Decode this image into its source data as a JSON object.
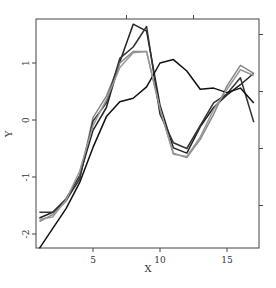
{
  "chart_data": {
    "type": "line",
    "title": "",
    "xlabel": "X",
    "ylabel": "Y",
    "xlim": [
      0.8,
      17.4
    ],
    "ylim": [
      -2.25,
      1.78
    ],
    "grid": false,
    "legend": null,
    "x_ticks": [
      5,
      10,
      15
    ],
    "y_ticks": [
      -2,
      -1,
      0,
      1
    ],
    "x": [
      1,
      2,
      3,
      4,
      5,
      6,
      7,
      8,
      9,
      10,
      11,
      12,
      13,
      14,
      15,
      16,
      17
    ],
    "series": [
      {
        "name": "series-1",
        "color": "#222222",
        "values": [
          -1.72,
          -1.62,
          -1.38,
          -0.98,
          -0.18,
          0.22,
          1.02,
          1.68,
          1.56,
          0.26,
          -0.49,
          -0.58,
          -0.12,
          0.22,
          0.44,
          0.62,
          0.82
        ]
      },
      {
        "name": "series-2",
        "color": "#888888",
        "values": [
          -1.78,
          -1.66,
          -1.42,
          -1.02,
          0.04,
          0.42,
          1.0,
          1.2,
          1.2,
          0.18,
          -0.58,
          -0.66,
          -0.34,
          0.1,
          0.6,
          0.96,
          0.82
        ]
      },
      {
        "name": "series-3",
        "color": "#333333",
        "values": [
          -1.62,
          -1.62,
          -1.4,
          -1.04,
          -0.02,
          0.3,
          1.08,
          1.28,
          1.64,
          0.1,
          -0.4,
          -0.5,
          -0.1,
          0.3,
          0.46,
          0.74,
          -0.04
        ]
      },
      {
        "name": "series-4",
        "color": "#111111",
        "values": [
          -2.25,
          -1.9,
          -1.55,
          -1.1,
          -0.48,
          0.06,
          0.32,
          0.38,
          0.58,
          1.0,
          1.06,
          0.86,
          0.54,
          0.56,
          0.48,
          0.56,
          0.3
        ]
      },
      {
        "name": "series-5",
        "color": "#999999",
        "values": [
          -1.74,
          -1.7,
          -1.4,
          -0.9,
          -0.1,
          0.36,
          0.92,
          1.18,
          1.2,
          0.2,
          -0.6,
          -0.64,
          -0.3,
          0.18,
          0.54,
          0.88,
          0.78
        ]
      }
    ]
  }
}
